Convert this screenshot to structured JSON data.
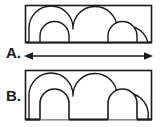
{
  "figure": {
    "background_color": "#ffffff",
    "line_color": "#1a1a1a",
    "labels": {
      "a": "A.",
      "b": "B."
    },
    "panel_a": {
      "name": "Arched profile A",
      "outline_shape": "rectangle",
      "bounds": {
        "x": 25,
        "y": 5,
        "width": 127,
        "height": 38
      },
      "inner_arches_top": 3,
      "inner_arches_lower": 2,
      "base": "flat solid base",
      "description": "Rectangular block with three upper arch curves and two lower arch curves, flat bottom edge"
    },
    "panel_b": {
      "name": "Arched profile B",
      "outline_shape": "rectangle",
      "bounds": {
        "x": 25,
        "y": 70,
        "width": 127,
        "height": 50
      },
      "inner_arches_top": 3,
      "inner_arches_lower": 2,
      "base": "open arch cutouts forming three feet",
      "description": "Rectangular block with three upper arch curves and two lower arch openings cut through to the bottom, leaving three feet"
    },
    "dimension_arrow": {
      "name": "width dimension arrow",
      "orientation": "horizontal",
      "heads": "double",
      "x_start": 24,
      "x_end": 153,
      "y": 56
    }
  }
}
